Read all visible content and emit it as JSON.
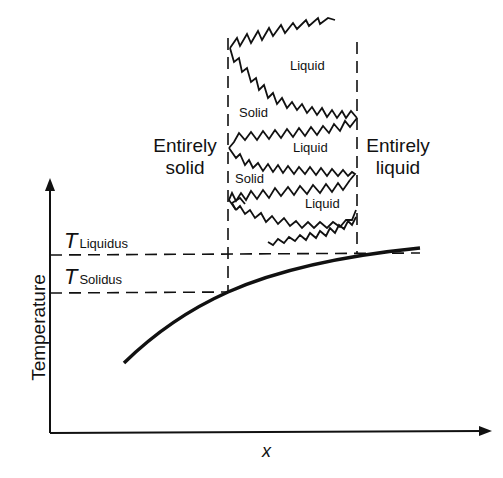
{
  "diagram": {
    "axes": {
      "y_label": "Temperature",
      "x_label": "x"
    },
    "levels": {
      "liquidus": {
        "symbol": "T",
        "subscript": "Liquidus"
      },
      "solidus": {
        "symbol": "T",
        "subscript": "Solidus"
      }
    },
    "regions": {
      "left": {
        "line1": "Entirely",
        "line2": "solid"
      },
      "right": {
        "line1": "Entirely",
        "line2": "liquid"
      }
    },
    "phase_labels": [
      "Liquid",
      "Solid",
      "Liquid",
      "Solid",
      "Liquid"
    ],
    "colors": {
      "ink": "#111111",
      "background": "#ffffff"
    }
  }
}
